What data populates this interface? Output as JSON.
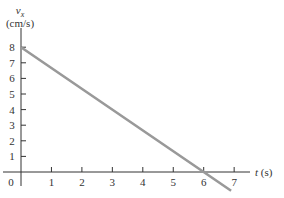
{
  "chart_data": {
    "type": "line",
    "title": "",
    "xlabel": "t (s)",
    "xlabel_var": "t",
    "xlabel_unit": "(s)",
    "ylabel_var": "v",
    "ylabel_sub": "x",
    "ylabel_unit": "(cm/s)",
    "xlim": [
      0,
      7
    ],
    "ylim": [
      0,
      8
    ],
    "x_ticks": [
      "1",
      "2",
      "3",
      "4",
      "5",
      "6",
      "7"
    ],
    "y_ticks": [
      "1",
      "2",
      "3",
      "4",
      "5",
      "6",
      "7",
      "8"
    ],
    "origin_label": "0",
    "grid": false,
    "series": [
      {
        "name": "v_x(t)",
        "color": "#999999",
        "x": [
          0,
          6,
          6.9
        ],
        "y": [
          8,
          0,
          -1.2
        ]
      }
    ]
  }
}
